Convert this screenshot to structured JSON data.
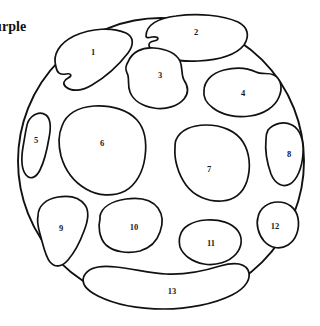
{
  "canvas": {
    "width": 320,
    "height": 326,
    "background": "#ffffff"
  },
  "annotation": {
    "text": "urple",
    "full_word_hint": "purple",
    "clipped_at_left_edge": true
  },
  "colors": {
    "stroke": "#111111",
    "fill": "#ffffff",
    "number_text": "#1a1a1a",
    "label_text": "#111111"
  },
  "figure": {
    "kind": "numbered-region-coloring-diagram",
    "outer_shape": "circle",
    "circle": {
      "cx": 161,
      "cy": 161,
      "r": 143
    },
    "region_count": 13
  },
  "regions": [
    {
      "id": 1,
      "label": "1",
      "number_x": 93,
      "number_y": 53,
      "path": "M 56 67 C 52 54 60 43 74 36 C 92 28 112 27 126 33 C 134 37 134 45 128 53 C 118 66 104 78 92 85 C 82 91 72 92 66 87 C 62 84 64 80 68 78 C 72 76 72 73 66 74 C 60 75 57 73 56 67 Z"
    },
    {
      "id": 2,
      "label": "2",
      "number_x": 196,
      "number_y": 33,
      "path": "M 146 36 C 146 25 158 18 176 16 C 198 13 222 15 238 22 C 248 27 250 36 244 45 C 236 55 218 60 198 61 C 178 62 162 58 153 51 C 147 46 148 42 154 41 C 160 40 159 36 152 37 C 148 38 146 38 146 36 Z"
    },
    {
      "id": 3,
      "label": "3",
      "number_x": 160,
      "number_y": 76,
      "path": "M 128 62 C 132 52 142 47 154 48 C 166 49 176 53 180 61 C 183 68 181 75 184 80 C 188 86 189 93 184 99 C 178 106 166 110 154 108 C 142 106 133 100 130 92 C 127 84 130 78 127 73 C 125 69 126 65 128 62 Z"
    },
    {
      "id": 4,
      "label": "4",
      "number_x": 243,
      "number_y": 94,
      "path": "M 204 91 C 204 81 212 73 224 70 C 236 67 248 68 256 72 C 262 75 268 72 274 75 C 281 79 283 88 279 97 C 275 107 264 114 250 116 C 236 118 222 115 213 108 C 205 102 203 97 204 91 Z"
    },
    {
      "id": 5,
      "label": "5",
      "number_x": 36,
      "number_y": 141,
      "path": "M 28 122 C 32 114 40 111 46 115 C 51 119 51 128 49 138 C 47 150 44 162 40 170 C 36 178 30 180 26 175 C 22 170 21 159 23 147 C 25 136 26 127 28 122 Z"
    },
    {
      "id": 6,
      "label": "6",
      "number_x": 102,
      "number_y": 144,
      "path": "M 62 126 C 66 114 78 107 94 106 C 112 105 128 110 137 120 C 145 129 147 142 145 157 C 143 172 136 185 125 191 C 113 197 98 196 86 189 C 74 182 65 170 61 156 C 58 144 59 133 62 126 Z"
    },
    {
      "id": 7,
      "label": "7",
      "number_x": 209,
      "number_y": 170,
      "path": "M 176 140 C 180 130 192 125 206 125 C 222 125 236 131 243 142 C 250 153 251 168 247 181 C 243 193 234 200 222 201 C 208 202 194 196 186 185 C 178 174 174 159 175 148 C 175 144 175 142 176 140 Z"
    },
    {
      "id": 8,
      "label": "8",
      "number_x": 289,
      "number_y": 155,
      "path": "M 268 130 C 274 123 284 121 292 125 C 300 129 304 140 303 154 C 302 168 297 180 290 184 C 283 188 275 184 271 174 C 267 163 265 149 266 139 C 266 134 267 132 268 130 Z"
    },
    {
      "id": 9,
      "label": "9",
      "number_x": 61,
      "number_y": 229,
      "path": "M 38 216 C 38 206 46 199 58 197 C 70 195 80 198 85 205 C 90 212 88 221 84 231 C 80 242 74 253 68 260 C 62 267 55 268 50 262 C 45 256 43 244 40 234 C 38 227 37 220 38 216 Z"
    },
    {
      "id": 10,
      "label": "10",
      "number_x": 134,
      "number_y": 228,
      "path": "M 100 216 C 102 207 112 201 126 199 C 140 197 152 200 158 208 C 163 215 163 224 160 232 C 157 241 150 248 140 251 C 128 254 114 252 106 245 C 99 238 98 226 100 219 C 100 218 100 217 100 216 Z"
    },
    {
      "id": 11,
      "label": "11",
      "number_x": 211,
      "number_y": 244,
      "path": "M 180 236 C 182 227 192 221 206 220 C 220 219 232 223 238 231 C 243 238 242 247 236 254 C 229 262 216 266 204 264 C 192 262 183 255 180 247 C 179 242 179 239 180 236 Z"
    },
    {
      "id": 12,
      "label": "12",
      "number_x": 275,
      "number_y": 227,
      "path": "M 258 217 C 260 208 268 202 278 202 C 288 202 296 208 298 218 C 300 229 296 240 288 245 C 280 250 270 248 264 241 C 258 234 256 224 258 217 Z"
    },
    {
      "id": 13,
      "label": "13",
      "number_x": 172,
      "number_y": 292,
      "path": "M 84 276 C 88 268 100 265 116 267 C 134 269 150 273 166 274 C 184 275 204 271 220 266 C 234 262 244 263 248 270 C 252 278 246 288 232 295 C 214 304 188 309 164 309 C 138 309 114 304 98 296 C 86 290 81 283 84 276 Z"
    }
  ]
}
